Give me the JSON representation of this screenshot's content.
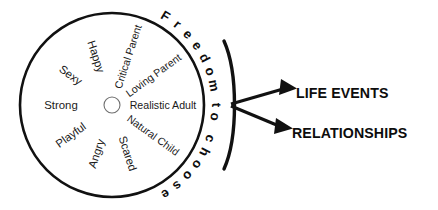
{
  "diagram": {
    "wheel": {
      "center_x": 112,
      "center_y": 105,
      "radius": 92,
      "hub_radius": 8,
      "sector_count": 10,
      "sectors": [
        {
          "label": "Realistic Adult",
          "angle_deg": 0
        },
        {
          "label": "Natural Child",
          "angle_deg": 36
        },
        {
          "label": "Scared",
          "angle_deg": 72
        },
        {
          "label": "Angry",
          "angle_deg": 108
        },
        {
          "label": "Playful",
          "angle_deg": 144
        },
        {
          "label": "Strong",
          "angle_deg": 180
        },
        {
          "label": "Sexy",
          "angle_deg": 216
        },
        {
          "label": "Happy",
          "angle_deg": 252
        },
        {
          "label": "Critical Parent",
          "angle_deg": 288
        },
        {
          "label": "Loving Parent",
          "angle_deg": 324
        }
      ]
    },
    "arc_title": {
      "text": "Freedom to choose",
      "start_angle_deg": -63,
      "end_angle_deg": 63,
      "radius": 104
    },
    "outcomes": [
      {
        "label": "LIFE EVENTS",
        "x": 296,
        "y": 93
      },
      {
        "label": "RELATIONSHIPS",
        "x": 292,
        "y": 133
      }
    ],
    "colors": {
      "ink": "#111111",
      "spoke": "#8c8c8c",
      "background": "#ffffff",
      "label_text": "#1a1a1a"
    }
  }
}
